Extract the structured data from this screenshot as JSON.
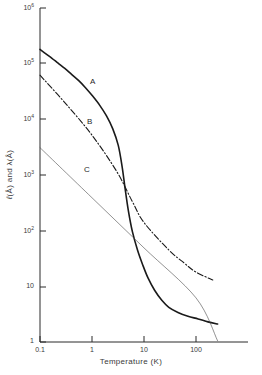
{
  "chart_data": {
    "type": "line",
    "title": "",
    "xlabel": "Temperature  (K)",
    "ylabel": "ℓ (Å) and  λ (Å)",
    "xscale": "log",
    "yscale": "log",
    "xlim": [
      0.1,
      1000
    ],
    "ylim": [
      1,
      1000000
    ],
    "grid": false,
    "legend_position": "inline-curve-labels",
    "xtick_labels": [
      "0.1",
      "1",
      "10",
      "100"
    ],
    "xtick_values": [
      0.1,
      1,
      10,
      100
    ],
    "ytick_labels": [
      "10⁶",
      "10⁵",
      "10⁴",
      "10³",
      "10²",
      "10",
      "1"
    ],
    "ytick_values": [
      1000000,
      100000,
      10000,
      1000,
      100,
      10,
      1
    ],
    "ytick_mantissa": [
      "10",
      "10",
      "10",
      "10",
      "10",
      "10",
      "1"
    ],
    "ytick_exponent": [
      "6",
      "5",
      "4",
      "3",
      "2",
      "",
      ""
    ],
    "series": [
      {
        "name": "A",
        "label": "A",
        "style": "solid",
        "linewidth": 1.6,
        "color": "#1a1a1a",
        "label_x": 1.05,
        "label_y": 46000,
        "points": [
          [
            0.1,
            180000
          ],
          [
            0.13,
            150000
          ],
          [
            0.17,
            125000
          ],
          [
            0.22,
            103000
          ],
          [
            0.3,
            82000
          ],
          [
            0.4,
            65000
          ],
          [
            0.55,
            50000
          ],
          [
            0.75,
            37000
          ],
          [
            1.0,
            27000
          ],
          [
            1.4,
            18000
          ],
          [
            1.9,
            11500
          ],
          [
            2.5,
            6800
          ],
          [
            3.2,
            3400
          ],
          [
            3.8,
            1400
          ],
          [
            4.3,
            600
          ],
          [
            5.0,
            230
          ],
          [
            6.0,
            95
          ],
          [
            7.5,
            45
          ],
          [
            9.5,
            24
          ],
          [
            12.0,
            14
          ],
          [
            16.0,
            8.5
          ],
          [
            22.0,
            5.6
          ],
          [
            30.0,
            4.2
          ],
          [
            45.0,
            3.4
          ],
          [
            70.0,
            2.9
          ],
          [
            110.0,
            2.6
          ],
          [
            170.0,
            2.3
          ],
          [
            260.0,
            2.1
          ]
        ]
      },
      {
        "name": "B",
        "label": "B",
        "style": "dash-dot",
        "linewidth": 1.1,
        "color": "#1a1a1a",
        "label_x": 0.92,
        "label_y": 9000,
        "points": [
          [
            0.1,
            62000
          ],
          [
            0.3,
            20000
          ],
          [
            1.0,
            5200
          ],
          [
            3.0,
            1150
          ],
          [
            6.0,
            330
          ],
          [
            10.0,
            140
          ],
          [
            30.0,
            45
          ],
          [
            60.0,
            26
          ],
          [
            100.0,
            18
          ],
          [
            210.0,
            13
          ]
        ]
      },
      {
        "name": "C",
        "label": "C",
        "style": "solid",
        "linewidth": 0.6,
        "color": "#4a4a4a",
        "label_x": 0.8,
        "label_y": 1250,
        "points": [
          [
            0.1,
            3100
          ],
          [
            1.0,
            390
          ],
          [
            10.0,
            49
          ],
          [
            100.0,
            6.2
          ],
          [
            260.0,
            1.05
          ]
        ]
      }
    ],
    "annotations": [
      {
        "text": "A",
        "x": 1.05,
        "y": 46000
      },
      {
        "text": "B",
        "x": 0.92,
        "y": 9000
      },
      {
        "text": "C",
        "x": 0.8,
        "y": 1250
      }
    ]
  },
  "axes": {
    "x_title": "Temperature  (K)",
    "y_title_parts": {
      "ell": "ℓ",
      "angstrom_1": "(Å)",
      "and": " and ",
      "lambda": "λ",
      "angstrom_2": "(Å)"
    }
  }
}
